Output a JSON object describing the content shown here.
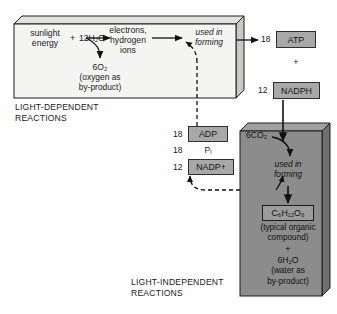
{
  "diagram": {
    "colors": {
      "light_box_fill": "#f2f2f0",
      "dark_box_fill": "#8c8c8c",
      "chip_fill": "#a8a8a8",
      "outline": "#1d1d1d",
      "text": "#1a1a1a"
    }
  },
  "light_dependent": {
    "section_label_line1": "LIGHT-DEPENDENT",
    "section_label_line2": "REACTIONS",
    "input_line1": "sunlight",
    "input_line2": "energy",
    "plus": "+",
    "water_reactant": "12H₂O",
    "products_line1": "electrons,",
    "products_line2": "hydrogen",
    "products_line3": "ions",
    "used_in": "used in",
    "forming": "forming",
    "oxygen": "6O₂",
    "oxygen_note_line1": "(oxygen as",
    "oxygen_note_line2": "by-product)"
  },
  "energy_carriers": {
    "atp_count": "18",
    "atp_label": "ATP",
    "plus": "+",
    "nadph_count": "12",
    "nadph_label": "NADPH"
  },
  "recycled": {
    "adp_count": "18",
    "adp_label": "ADP",
    "pi_count": "18",
    "pi_label": "Pᵢ",
    "nadp_count": "12",
    "nadp_label": "NADP+"
  },
  "light_independent": {
    "section_label_line1": "LIGHT-INDEPENDENT",
    "section_label_line2": "REACTIONS",
    "carbon_input": "6CO₂",
    "used_in": "used in",
    "forming": "forming",
    "glucose_label": "C₆H₁₂O₆",
    "glucose_note_line1": "(typical organic",
    "glucose_note_line2": "compound)",
    "plus": "+",
    "water_product": "6H₂O",
    "water_note_line1": "(water as",
    "water_note_line2": "by-product)"
  }
}
